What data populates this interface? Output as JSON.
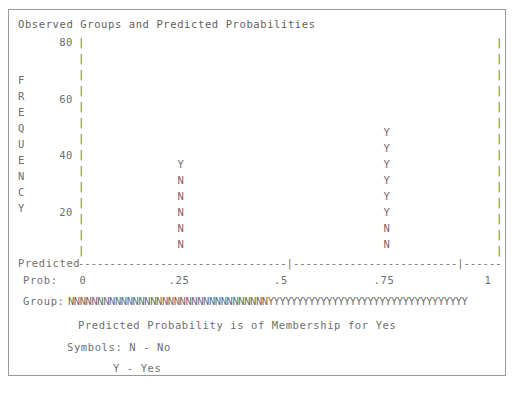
{
  "chart_data": {
    "type": "bar",
    "title": "Observed Groups and Predicted Probabilities",
    "xlabel": "Predicted",
    "ylabel": "FREQUENCY",
    "x_axis_name": "Prob:",
    "ylim": [
      0,
      80
    ],
    "y_ticks": [
      "80",
      "60",
      "40",
      "20"
    ],
    "x_ticks": [
      "0",
      ".25",
      ".5",
      ".75",
      "1"
    ],
    "xlim": [
      0,
      1
    ],
    "grid": false,
    "legend": "none",
    "symbol_scale": 5,
    "symbol_scale_note": "Each Symbol Represents 5 Cases.",
    "legend_lines": [
      "Predicted Probability is of Membership for Yes",
      "Symbols: N - No",
      "Y - Yes"
    ],
    "symbols": {
      "N": "No",
      "Y": "Yes"
    },
    "columns": [
      {
        "name": "left-column",
        "x_position": ".25",
        "top_value": 30,
        "stack": [
          "Y",
          "N",
          "N",
          "N",
          "N",
          "N"
        ]
      },
      {
        "name": "right-column",
        "x_position": ".75",
        "top_value": 40,
        "stack": [
          "Y",
          "Y",
          "Y",
          "Y",
          "Y",
          "Y",
          "N",
          "N"
        ]
      }
    ],
    "group_strip_label": "Group:",
    "group_strip": "NNNNNNNNNNNNNNNNNNNNNNNNNNNNNNNNNNYYYYYYYYYYYYYYYYYYYYYYYYYYYYYYYYYY"
  },
  "axis": {
    "pipe_glyph": "|",
    "dash_segment_left": "---------------------------------",
    "dash_segment_mid": "--------------------------",
    "dash_segment_right": "------",
    "tick_glyph": "|"
  },
  "colors": {
    "text": "#6e6e6e",
    "border": "#9a9a9a",
    "background": "#ffffff"
  }
}
